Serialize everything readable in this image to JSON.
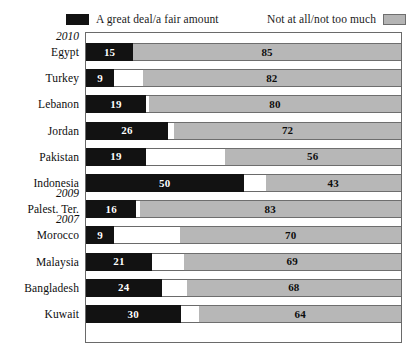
{
  "legend": {
    "left": {
      "label": "A great deal/a fair amount",
      "swatch": "black-swatch",
      "color": "#121212"
    },
    "right": {
      "label": "Not at all/not too much",
      "swatch": "gray-swatch",
      "color": "#b7b7b7"
    }
  },
  "chart_data": {
    "type": "bar",
    "subtype": "stacked-horizontal-bar",
    "title": "",
    "xlabel": "",
    "ylabel": "",
    "xlim": [
      0,
      100
    ],
    "grid": false,
    "legend_position": "top",
    "categories": [
      "Egypt",
      "Turkey",
      "Lebanon",
      "Jordan",
      "Pakistan",
      "Indonesia",
      "Palest. Ter.",
      "Morocco",
      "Malaysia",
      "Bangladesh",
      "Kuwait"
    ],
    "group_labels": [
      {
        "label": "2010",
        "before": "Egypt"
      },
      {
        "label": "2009",
        "before": "Palest. Ter."
      },
      {
        "label": "2007",
        "before": "Morocco"
      }
    ],
    "series": [
      {
        "name": "A great deal/a fair amount",
        "color": "#121212",
        "values": [
          15,
          9,
          19,
          26,
          19,
          50,
          16,
          9,
          21,
          24,
          30
        ]
      },
      {
        "name": "Unlabeled remainder",
        "color": "#ffffff",
        "values": [
          0,
          9,
          1,
          2,
          25,
          7,
          1,
          21,
          10,
          8,
          6
        ]
      },
      {
        "name": "Not at all/not too much",
        "color": "#b7b7b7",
        "values": [
          85,
          82,
          80,
          72,
          56,
          43,
          83,
          70,
          69,
          68,
          64
        ]
      }
    ]
  },
  "rows": [
    {
      "country": "Egypt",
      "year": "2010",
      "black": 15,
      "gap": 0,
      "gray": 85
    },
    {
      "country": "Turkey",
      "year": "",
      "black": 9,
      "gap": 9,
      "gray": 82
    },
    {
      "country": "Lebanon",
      "year": "",
      "black": 19,
      "gap": 1,
      "gray": 80
    },
    {
      "country": "Jordan",
      "year": "",
      "black": 26,
      "gap": 2,
      "gray": 72
    },
    {
      "country": "Pakistan",
      "year": "",
      "black": 19,
      "gap": 25,
      "gray": 56
    },
    {
      "country": "Indonesia",
      "year": "",
      "black": 50,
      "gap": 7,
      "gray": 43
    },
    {
      "country": "Palest. Ter.",
      "year": "2009",
      "black": 16,
      "gap": 1,
      "gray": 83
    },
    {
      "country": "Morocco",
      "year": "2007",
      "black": 9,
      "gap": 21,
      "gray": 70
    },
    {
      "country": "Malaysia",
      "year": "",
      "black": 21,
      "gap": 10,
      "gray": 69
    },
    {
      "country": "Bangladesh",
      "year": "",
      "black": 24,
      "gap": 8,
      "gray": 68
    },
    {
      "country": "Kuwait",
      "year": "",
      "black": 30,
      "gap": 6,
      "gray": 64
    }
  ]
}
